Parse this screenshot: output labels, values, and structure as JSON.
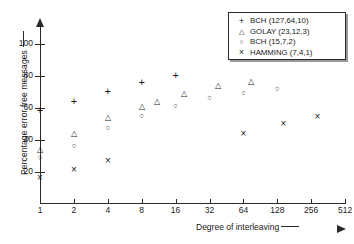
{
  "chart_data": {
    "type": "scatter",
    "title": "",
    "xlabel": "Degree of interleaving",
    "ylabel": "Percentage error free messages",
    "xscale": "log2",
    "xlim": [
      1,
      700
    ],
    "ylim": [
      0,
      110
    ],
    "xticks": [
      "1",
      "2",
      "4",
      "8",
      "16",
      "32",
      "64",
      "128",
      "256",
      "512"
    ],
    "xtick_values": [
      1,
      2,
      4,
      8,
      16,
      32,
      64,
      128,
      256,
      512
    ],
    "yticks": [
      "20",
      "40",
      "60",
      "80",
      "100"
    ],
    "ytick_values": [
      20,
      40,
      60,
      80,
      100
    ],
    "grid": false,
    "legend_position": "top-right",
    "series": [
      {
        "name": "BCH (127,64,10)",
        "marker": "plus-marker",
        "points": [
          {
            "x": 1,
            "y": 58
          },
          {
            "x": 2,
            "y": 64
          },
          {
            "x": 4,
            "y": 70
          },
          {
            "x": 8,
            "y": 75.5
          },
          {
            "x": 16,
            "y": 80
          }
        ]
      },
      {
        "name": "GOLAY (23,12,3)",
        "marker": "triangle-marker",
        "points": [
          {
            "x": 1,
            "y": 34
          },
          {
            "x": 2,
            "y": 43.5
          },
          {
            "x": 4,
            "y": 54
          },
          {
            "x": 8,
            "y": 60.5
          },
          {
            "x": 11,
            "y": 64
          },
          {
            "x": 19,
            "y": 69
          },
          {
            "x": 38,
            "y": 73.5
          },
          {
            "x": 75,
            "y": 76
          }
        ]
      },
      {
        "name": "BCH (15,7,2)",
        "marker": "circle-marker",
        "points": [
          {
            "x": 1,
            "y": 29
          },
          {
            "x": 2,
            "y": 36.5
          },
          {
            "x": 4,
            "y": 47.5
          },
          {
            "x": 8,
            "y": 55
          },
          {
            "x": 16,
            "y": 61
          },
          {
            "x": 32,
            "y": 66
          },
          {
            "x": 64,
            "y": 69.5
          },
          {
            "x": 128,
            "y": 72
          }
        ]
      },
      {
        "name": "HAMMING (7,4,1)",
        "marker": "cross-marker",
        "points": [
          {
            "x": 1,
            "y": 16
          },
          {
            "x": 2,
            "y": 21.5
          },
          {
            "x": 4,
            "y": 27
          },
          {
            "x": 64,
            "y": 43.5
          },
          {
            "x": 145,
            "y": 50
          },
          {
            "x": 290,
            "y": 54.5
          }
        ]
      }
    ]
  },
  "legend": {
    "entries": [
      {
        "symbol": "plus-marker",
        "label": "BCH (127,64,10)"
      },
      {
        "symbol": "triangle-marker",
        "label": "GOLAY (23,12,3)"
      },
      {
        "symbol": "circle-marker",
        "label": "BCH (15,7,2)"
      },
      {
        "symbol": "cross-marker",
        "label": "HAMMING (7,4,1)"
      }
    ]
  },
  "colors": {
    "ink": "#1a1a1a",
    "axis": "#2a2a2a",
    "background": "#ffffff",
    "legend_shadow": "#9a9a9a"
  }
}
